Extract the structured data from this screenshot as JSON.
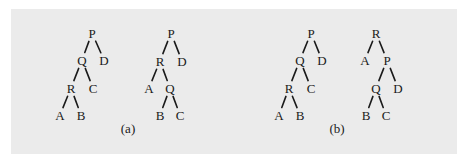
{
  "figure": {
    "panels": [
      {
        "caption": "(a)",
        "caption_pos": [
          128,
          133
        ],
        "trees": [
          {
            "id": "a-left",
            "nodes": [
              {
                "label": "P",
                "x": 92,
                "y": 33
              },
              {
                "label": "Q",
                "x": 82,
                "y": 60
              },
              {
                "label": "D",
                "x": 104,
                "y": 60
              },
              {
                "label": "R",
                "x": 71,
                "y": 88
              },
              {
                "label": "C",
                "x": 93,
                "y": 88
              },
              {
                "label": "A",
                "x": 60,
                "y": 115
              },
              {
                "label": "B",
                "x": 81,
                "y": 115
              }
            ],
            "edges": [
              [
                "P",
                "Q"
              ],
              [
                "P",
                "D"
              ],
              [
                "Q",
                "R"
              ],
              [
                "Q",
                "C"
              ],
              [
                "R",
                "A"
              ],
              [
                "R",
                "B"
              ]
            ]
          },
          {
            "id": "a-right",
            "nodes": [
              {
                "label": "P",
                "x": 171,
                "y": 33
              },
              {
                "label": "R",
                "x": 160,
                "y": 61
              },
              {
                "label": "D",
                "x": 182,
                "y": 61
              },
              {
                "label": "A",
                "x": 149,
                "y": 88
              },
              {
                "label": "Q",
                "x": 170,
                "y": 88
              },
              {
                "label": "B",
                "x": 160,
                "y": 115
              },
              {
                "label": "C",
                "x": 180,
                "y": 115
              }
            ],
            "edges": [
              [
                "P",
                "R"
              ],
              [
                "P",
                "D"
              ],
              [
                "R",
                "A"
              ],
              [
                "R",
                "Q"
              ],
              [
                "Q",
                "B"
              ],
              [
                "Q",
                "C"
              ]
            ]
          }
        ]
      },
      {
        "caption": "(b)",
        "caption_pos": [
          337,
          133
        ],
        "trees": [
          {
            "id": "b-left",
            "nodes": [
              {
                "label": "P",
                "x": 311,
                "y": 33
              },
              {
                "label": "Q",
                "x": 300,
                "y": 60
              },
              {
                "label": "D",
                "x": 322,
                "y": 60
              },
              {
                "label": "R",
                "x": 289,
                "y": 88
              },
              {
                "label": "C",
                "x": 311,
                "y": 88
              },
              {
                "label": "A",
                "x": 279,
                "y": 115
              },
              {
                "label": "B",
                "x": 300,
                "y": 115
              }
            ],
            "edges": [
              [
                "P",
                "Q"
              ],
              [
                "P",
                "D"
              ],
              [
                "Q",
                "R"
              ],
              [
                "Q",
                "C"
              ],
              [
                "R",
                "A"
              ],
              [
                "R",
                "B"
              ]
            ]
          },
          {
            "id": "b-right",
            "nodes": [
              {
                "label": "R",
                "x": 376,
                "y": 33
              },
              {
                "label": "A",
                "x": 365,
                "y": 60
              },
              {
                "label": "P",
                "x": 387,
                "y": 60
              },
              {
                "label": "Q",
                "x": 376,
                "y": 88
              },
              {
                "label": "D",
                "x": 398,
                "y": 88
              },
              {
                "label": "B",
                "x": 366,
                "y": 115
              },
              {
                "label": "C",
                "x": 386,
                "y": 115
              }
            ],
            "edges": [
              [
                "R",
                "A"
              ],
              [
                "R",
                "P"
              ],
              [
                "P",
                "Q"
              ],
              [
                "P",
                "D"
              ],
              [
                "Q",
                "B"
              ],
              [
                "Q",
                "C"
              ]
            ]
          }
        ]
      }
    ]
  },
  "colors": {
    "panel_background": "#ebebeb",
    "ink": "#1a1a1a"
  }
}
